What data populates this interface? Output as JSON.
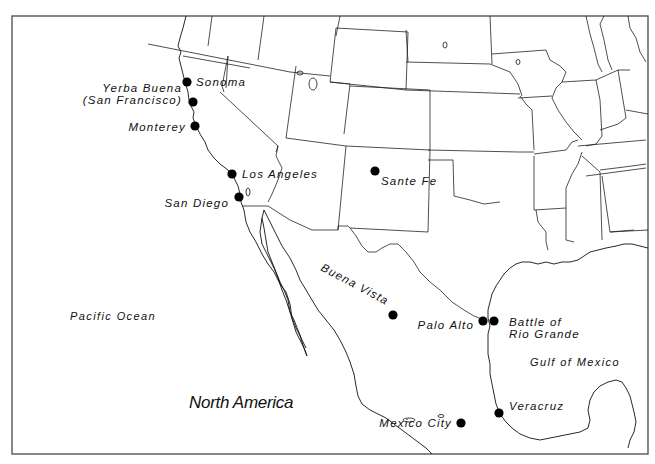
{
  "map": {
    "region_label": "North America",
    "water_bodies": [
      {
        "name": "Pacific Ocean",
        "x": 70,
        "y": 320
      },
      {
        "name": "Gulf of Mexico",
        "x": 530,
        "y": 366
      }
    ],
    "cities": [
      {
        "name": "Sonoma",
        "dot_x": 187,
        "dot_y": 82,
        "label_x": 196,
        "label_y": 86,
        "anchor": "start"
      },
      {
        "name": "Yerba Buena",
        "name_line2": "(San Francisco)",
        "dot_x": 193,
        "dot_y": 102,
        "label_x": 182,
        "label_y": 92,
        "anchor": "end"
      },
      {
        "name": "Monterey",
        "dot_x": 195,
        "dot_y": 126,
        "label_x": 186,
        "label_y": 131,
        "anchor": "end"
      },
      {
        "name": "Los Angeles",
        "dot_x": 232,
        "dot_y": 174,
        "label_x": 242,
        "label_y": 178,
        "anchor": "start"
      },
      {
        "name": "San Diego",
        "dot_x": 239,
        "dot_y": 197,
        "label_x": 229,
        "label_y": 207,
        "anchor": "end"
      },
      {
        "name": "Sante Fe",
        "dot_x": 375,
        "dot_y": 171,
        "label_x": 381,
        "label_y": 185,
        "anchor": "start"
      },
      {
        "name": "Buena Vista",
        "dot_x": 393,
        "dot_y": 315,
        "label_x": 320,
        "label_y": 270,
        "anchor": "start",
        "rotate": 28
      },
      {
        "name": "Palo Alto",
        "dot_x": 483,
        "dot_y": 321,
        "label_x": 474,
        "label_y": 329,
        "anchor": "end"
      },
      {
        "name": "Battle of",
        "name_line2": "Rio Grande",
        "dot_x": 494,
        "dot_y": 321,
        "label_x": 509,
        "label_y": 326,
        "anchor": "start"
      },
      {
        "name": "Veracruz",
        "dot_x": 499,
        "dot_y": 413,
        "label_x": 509,
        "label_y": 410,
        "anchor": "start"
      },
      {
        "name": "Mexico City",
        "dot_x": 461,
        "dot_y": 423,
        "label_x": 452,
        "label_y": 427,
        "anchor": "end"
      }
    ],
    "colors": {
      "background": "#ffffff",
      "lines": "#111111",
      "dots": "#000000"
    }
  }
}
